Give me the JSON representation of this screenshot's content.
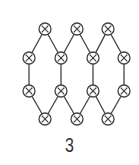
{
  "figure": {
    "label": "3",
    "stroke_color": "#444444",
    "background": "#ffffff",
    "node_radius": 6,
    "node_symbol": "circled-x"
  },
  "nodes": [
    {
      "id": "r1c1",
      "x": 45,
      "y": 29
    },
    {
      "id": "r1c2",
      "x": 77,
      "y": 29
    },
    {
      "id": "r1c3",
      "x": 108,
      "y": 29
    },
    {
      "id": "r2c1",
      "x": 29,
      "y": 58
    },
    {
      "id": "r2c2",
      "x": 61,
      "y": 58
    },
    {
      "id": "r2c3",
      "x": 93,
      "y": 58
    },
    {
      "id": "r2c4",
      "x": 124,
      "y": 58
    },
    {
      "id": "r3c1",
      "x": 29,
      "y": 91
    },
    {
      "id": "r3c2",
      "x": 61,
      "y": 91
    },
    {
      "id": "r3c3",
      "x": 93,
      "y": 91
    },
    {
      "id": "r3c4",
      "x": 124,
      "y": 91
    },
    {
      "id": "r4c1",
      "x": 45,
      "y": 119
    },
    {
      "id": "r4c2",
      "x": 77,
      "y": 119
    },
    {
      "id": "r4c3",
      "x": 108,
      "y": 119
    }
  ],
  "edges": [
    [
      "r1c1",
      "r2c1"
    ],
    [
      "r1c1",
      "r2c2"
    ],
    [
      "r1c2",
      "r2c2"
    ],
    [
      "r1c2",
      "r2c3"
    ],
    [
      "r1c3",
      "r2c3"
    ],
    [
      "r1c3",
      "r2c4"
    ],
    [
      "r2c1",
      "r3c1"
    ],
    [
      "r2c2",
      "r3c2"
    ],
    [
      "r2c3",
      "r3c3"
    ],
    [
      "r2c4",
      "r3c4"
    ],
    [
      "r3c1",
      "r4c1"
    ],
    [
      "r3c2",
      "r4c1"
    ],
    [
      "r3c2",
      "r4c2"
    ],
    [
      "r3c3",
      "r4c2"
    ],
    [
      "r3c3",
      "r4c3"
    ],
    [
      "r3c4",
      "r4c3"
    ]
  ]
}
